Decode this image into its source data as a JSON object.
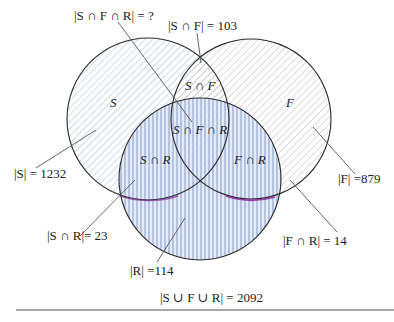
{
  "diagram": {
    "type": "venn-3",
    "sets": [
      {
        "name": "S",
        "label": "S",
        "cx": 148,
        "cy": 119,
        "r": 81,
        "hatch": "diagonal-light-blue"
      },
      {
        "name": "F",
        "label": "F",
        "cx": 251,
        "cy": 119,
        "r": 80,
        "hatch": "diagonal-light-gray"
      },
      {
        "name": "R",
        "label": "R",
        "cx": 200,
        "cy": 179,
        "r": 81,
        "hatch": "vertical-blue"
      }
    ],
    "region_labels": {
      "S": "S",
      "F": "F",
      "S_and_F": "S ∩ F",
      "S_and_R": "S ∩ R",
      "F_and_R": "F ∩ R",
      "S_and_F_and_R": "S ∩ F ∩ R"
    },
    "annotations": {
      "sfr": "|S ∩ F ∩ R| = ?",
      "sf": "|S ∩ F| = 103",
      "s": "|S| = 1232",
      "f": "|F| =879",
      "sr": "|S ∩ R|= 23",
      "fr": "|F ∩ R| = 14",
      "r": "|R| =114",
      "union": "|S ∪ F ∪ R| = 2092"
    },
    "values": {
      "S": 1232,
      "F": 879,
      "R": 114,
      "S_and_F": 103,
      "S_and_R": 23,
      "F_and_R": 14,
      "S_and_F_and_R": "?",
      "union": 2092
    },
    "colors": {
      "outline": "#2a2a2a",
      "s_hatch": "#b9c9dc",
      "f_hatch": "#c8c8c8",
      "r_hatch": "#6f8fc4",
      "r_fill": "#dfe7f4",
      "leader": "#555555",
      "rule": "#888888"
    }
  }
}
